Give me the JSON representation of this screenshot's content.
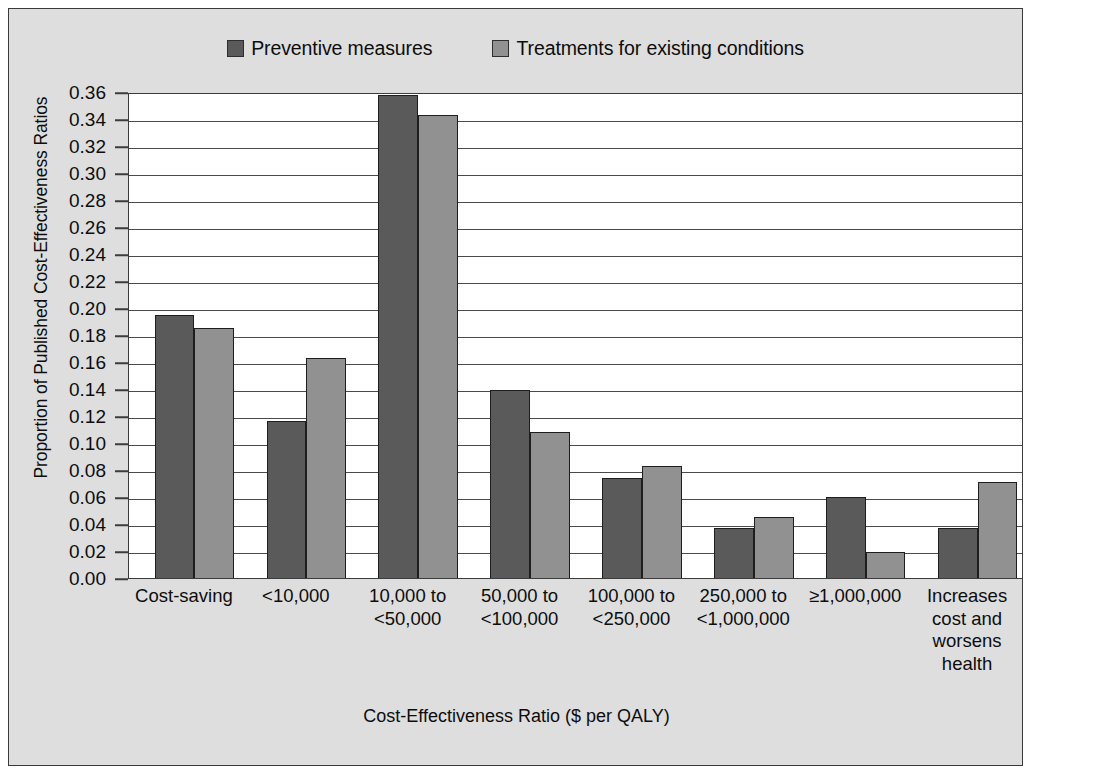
{
  "chart_data": {
    "type": "bar",
    "title": "",
    "xlabel": "Cost-Effectiveness Ratio ($ per QALY)",
    "ylabel": "Proportion of Published Cost-Effectiveness Ratios",
    "ylim": [
      0,
      0.36
    ],
    "ytick_step": 0.02,
    "grid": true,
    "legend_position": "top-center",
    "categories": [
      "Cost-saving",
      "<10,000",
      "10,000 to\n<50,000",
      "50,000 to\n<100,000",
      "100,000 to\n<250,000",
      "250,000 to\n<1,000,000",
      "≥1,000,000",
      "Increases\ncost and\nworsens\nhealth"
    ],
    "category_lines": [
      [
        "Cost-saving"
      ],
      [
        "<10,000"
      ],
      [
        "10,000 to",
        "<50,000"
      ],
      [
        "50,000 to",
        "<100,000"
      ],
      [
        "100,000 to",
        "<250,000"
      ],
      [
        "250,000 to",
        "<1,000,000"
      ],
      [
        "≥1,000,000"
      ],
      [
        "Increases",
        "cost and",
        "worsens",
        "health"
      ]
    ],
    "ytick_labels": [
      "0.36",
      "0.34",
      "0.32",
      "0.30",
      "0.28",
      "0.26",
      "0.24",
      "0.22",
      "0.20",
      "0.18",
      "0.16",
      "0.14",
      "0.12",
      "0.10",
      "0.08",
      "0.06",
      "0.04",
      "0.02",
      "0.00"
    ],
    "ytick_values": [
      0.36,
      0.34,
      0.32,
      0.3,
      0.28,
      0.26,
      0.24,
      0.22,
      0.2,
      0.18,
      0.16,
      0.14,
      0.12,
      0.1,
      0.08,
      0.06,
      0.04,
      0.02,
      0.0
    ],
    "series": [
      {
        "name": "Preventive measures",
        "color": "#5a5a5a",
        "values": [
          0.195,
          0.116,
          0.358,
          0.139,
          0.074,
          0.037,
          0.06,
          0.037
        ]
      },
      {
        "name": "Treatments for existing conditions",
        "color": "#919191",
        "values": [
          0.185,
          0.163,
          0.343,
          0.108,
          0.083,
          0.045,
          0.019,
          0.071
        ]
      }
    ]
  },
  "colors": {
    "figure_background": "#dedede",
    "plot_background": "#ffffff",
    "border": "#3a3a3a",
    "gridline": "#4a4a4a",
    "text": "#0d0d0d",
    "series_preventive": "#5a5a5a",
    "series_treatments": "#919191"
  }
}
